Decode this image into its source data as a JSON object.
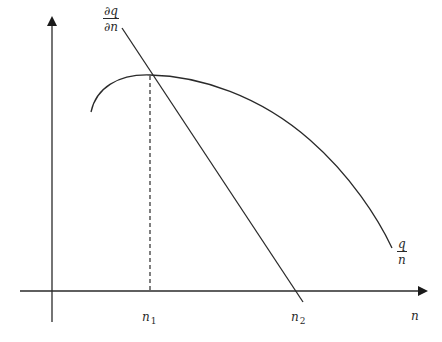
{
  "diagram": {
    "colors": {
      "line": "#2a2a2a",
      "background": "#ffffff"
    },
    "axes": {
      "x": {
        "label": "n",
        "from": [
          20,
          291
        ],
        "to": [
          428,
          291
        ],
        "arrow": true
      },
      "y": {
        "label": "",
        "from": [
          52,
          322
        ],
        "to": [
          52,
          16
        ],
        "arrow": true
      }
    },
    "curves": [
      {
        "name": "average-product-curve",
        "label_num": "q",
        "label_den": "n",
        "type": "concave-curve",
        "start": [
          91,
          112
        ],
        "peak": [
          150,
          75
        ],
        "end": [
          392,
          248
        ]
      },
      {
        "name": "marginal-product-line",
        "label_num": "∂q",
        "label_den": "∂n",
        "type": "line",
        "start": [
          122,
          28
        ],
        "end": [
          303,
          302
        ]
      }
    ],
    "reference_lines": [
      {
        "name": "n1-dashed-line",
        "style": "dashed",
        "from": [
          150,
          75
        ],
        "to": [
          150,
          291
        ]
      }
    ],
    "tick_labels": [
      {
        "name": "n1-label",
        "base": "n",
        "sub": "1",
        "pos": [
          144,
          312
        ]
      },
      {
        "name": "n2-label",
        "base": "n",
        "sub": "2",
        "pos": [
          292,
          312
        ]
      }
    ],
    "labels": {
      "x_axis": "n",
      "ap_num": "q",
      "ap_den": "n",
      "mp_num": "∂q",
      "mp_den": "∂n",
      "n1_base": "n",
      "n1_sub": "1",
      "n2_base": "n",
      "n2_sub": "2"
    }
  }
}
